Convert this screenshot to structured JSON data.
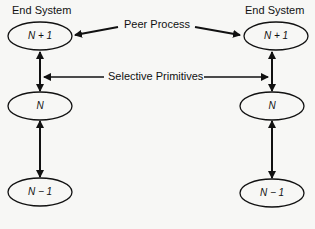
{
  "diagram": {
    "left_system": {
      "title": "End System",
      "nodes": [
        {
          "label": "N + 1"
        },
        {
          "label": "N"
        },
        {
          "label": "N − 1"
        }
      ]
    },
    "right_system": {
      "title": "End System",
      "nodes": [
        {
          "label": "N + 1"
        },
        {
          "label": "N"
        },
        {
          "label": "N − 1"
        }
      ]
    },
    "annotations": {
      "peer_process": "Peer Process",
      "selective_primitives": "Selective Primitives"
    },
    "colors": {
      "line": "#111111",
      "background": "#f7f7f5"
    }
  }
}
